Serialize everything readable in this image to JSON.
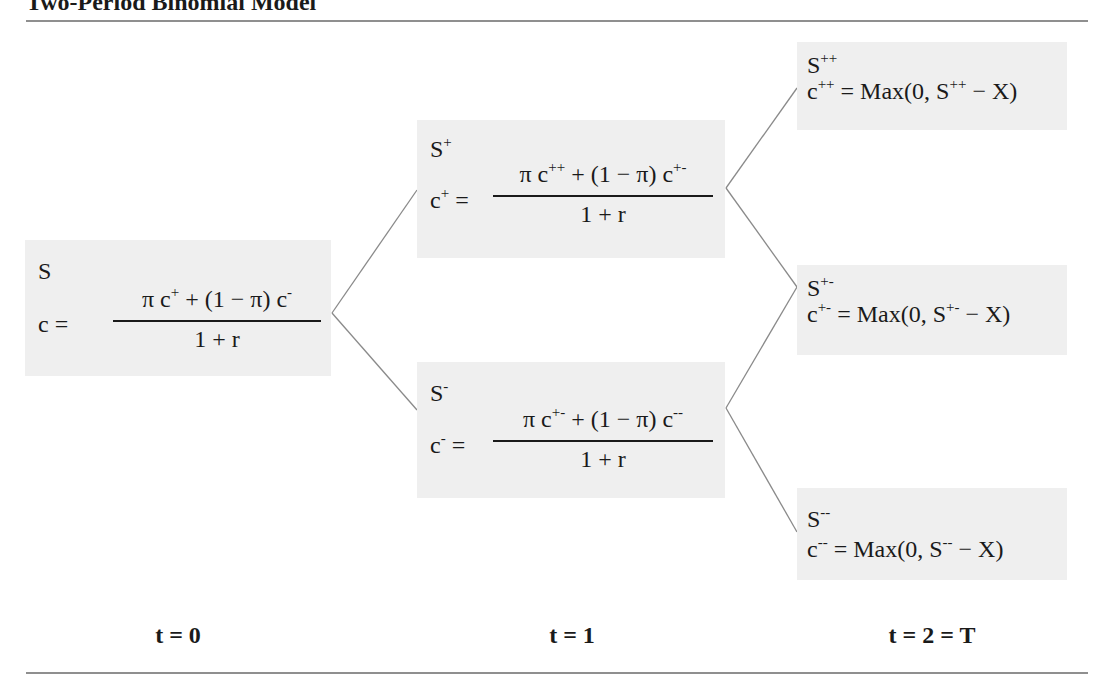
{
  "title": "Two-Period Binomial Model",
  "nodes": {
    "t0": {
      "stock": "S",
      "stock_sup": "",
      "call_lhs": "c",
      "call_lhs_sup": "",
      "eq": " =",
      "num_parts": [
        "π c",
        "+",
        " + (1 − π) c",
        "-"
      ],
      "den": "1 + r"
    },
    "t1_up": {
      "stock": "S",
      "stock_sup": "+",
      "call_lhs": "c",
      "call_lhs_sup": "+",
      "eq": " =",
      "num_parts": [
        "π c",
        "++",
        " + (1 − π) c",
        "+-"
      ],
      "den": "1 + r"
    },
    "t1_down": {
      "stock": "S",
      "stock_sup": "-",
      "call_lhs": "c",
      "call_lhs_sup": "-",
      "eq": " =",
      "num_parts": [
        "π c",
        "+-",
        " + (1 − π) c",
        "--"
      ],
      "den": "1 + r"
    },
    "t2_uu": {
      "stock": "S",
      "stock_sup": "++",
      "call_lhs": "c",
      "call_lhs_sup": "++",
      "payoff_pre": " = Max(0, S",
      "payoff_sup": "++",
      "payoff_post": " − X)"
    },
    "t2_ud": {
      "stock": "S",
      "stock_sup": "+-",
      "call_lhs": "c",
      "call_lhs_sup": "+-",
      "payoff_pre": " = Max(0, S",
      "payoff_sup": "+-",
      "payoff_post": " − X)"
    },
    "t2_dd": {
      "stock": "S",
      "stock_sup": "--",
      "call_lhs": "c",
      "call_lhs_sup": "--",
      "payoff_pre": " = Max(0, S",
      "payoff_sup": "--",
      "payoff_post": " − X)"
    }
  },
  "time_labels": [
    "t = 0",
    "t = 1",
    "t = 2 = T"
  ],
  "colors": {
    "box_fill": "#efefef",
    "edge": "#8a8a8a",
    "rule": "#8f8f8f",
    "text": "#1a1a1a"
  }
}
